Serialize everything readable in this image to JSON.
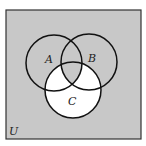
{
  "diagram": {
    "type": "venn",
    "universe_label": "U",
    "sets": [
      {
        "label": "A",
        "cx": 54,
        "cy": 63,
        "r": 28
      },
      {
        "label": "B",
        "cx": 89,
        "cy": 62,
        "r": 28
      },
      {
        "label": "C",
        "cx": 73,
        "cy": 90,
        "r": 28
      }
    ],
    "shaded_region": "complement of (C minus (A ∩ B))",
    "colors": {
      "shaded": "#c8c8c8",
      "unshaded": "#ffffff",
      "stroke": "#111111"
    },
    "frame": {
      "x": 6,
      "y": 10,
      "width": 135,
      "height": 129
    }
  }
}
